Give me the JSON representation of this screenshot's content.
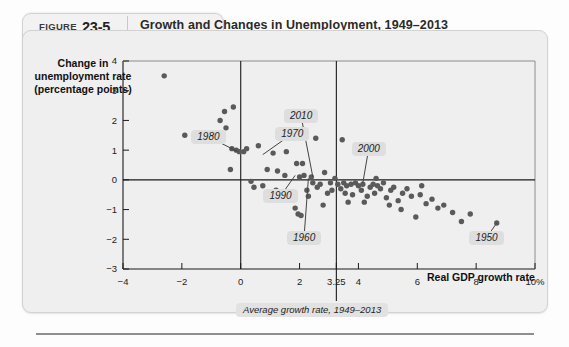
{
  "figure": {
    "label_word": "Figure",
    "number": "23-5",
    "title": "Growth and Changes in Unemployment, 1949–2013"
  },
  "axes": {
    "ylabel": "Change in unemployment rate (percentage points)",
    "xlabel": "Real GDP growth rate",
    "x_unit_suffix": "10%",
    "average_note": "Average growth rate, 1949–2013"
  },
  "chart_data": {
    "type": "scatter",
    "title": "Growth and Changes in Unemployment, 1949–2013",
    "xlabel": "Real GDP growth rate",
    "ylabel": "Change in unemployment rate (percentage points)",
    "xlim": [
      -4,
      10
    ],
    "ylim": [
      -3,
      4
    ],
    "xticks": [
      -4,
      -2,
      0,
      2,
      3.25,
      4,
      6,
      8,
      10
    ],
    "xticklabels": [
      "−4",
      "−2",
      "0",
      "2",
      "3.25",
      "4",
      "6",
      "8",
      "10%"
    ],
    "yticks": [
      4,
      3,
      2,
      1,
      0,
      -1,
      -2,
      -3
    ],
    "yticklabels": [
      "4",
      "3",
      "2",
      "1",
      "0",
      "−1",
      "−2",
      "−3"
    ],
    "grid": false,
    "legend": null,
    "reference_lines": [
      {
        "axis": "y",
        "value": 0,
        "style": "solid"
      },
      {
        "axis": "x",
        "value": 0,
        "style": "solid"
      },
      {
        "axis": "x",
        "value": 3.25,
        "style": "solid",
        "note": "Average growth rate, 1949–2013"
      }
    ],
    "marker_color": "#5a5a5a",
    "points": [
      [
        -2.6,
        3.5
      ],
      [
        -1.9,
        1.5
      ],
      [
        -0.55,
        2.3
      ],
      [
        -0.7,
        2.0
      ],
      [
        -0.5,
        1.75
      ],
      [
        -0.25,
        2.45
      ],
      [
        -0.3,
        1.05
      ],
      [
        -0.15,
        1.0
      ],
      [
        -0.05,
        0.95
      ],
      [
        0.1,
        0.95
      ],
      [
        0.2,
        1.05
      ],
      [
        -0.35,
        0.35
      ],
      [
        0.6,
        1.15
      ],
      [
        0.9,
        0.35
      ],
      [
        1.1,
        0.9
      ],
      [
        1.25,
        0.3
      ],
      [
        1.5,
        0.15
      ],
      [
        1.55,
        0.95
      ],
      [
        1.75,
        1.55
      ],
      [
        1.9,
        0.55
      ],
      [
        2.0,
        0.1
      ],
      [
        2.1,
        0.55
      ],
      [
        2.15,
        0.15
      ],
      [
        2.25,
        -0.35
      ],
      [
        2.3,
        -0.55
      ],
      [
        2.4,
        0.1
      ],
      [
        2.45,
        -0.1
      ],
      [
        2.55,
        1.4
      ],
      [
        2.6,
        -0.25
      ],
      [
        2.7,
        -0.15
      ],
      [
        2.85,
        0.25
      ],
      [
        2.95,
        -0.45
      ],
      [
        3.05,
        -0.1
      ],
      [
        3.1,
        -0.35
      ],
      [
        3.3,
        -0.15
      ],
      [
        3.4,
        -0.3
      ],
      [
        3.5,
        -0.1
      ],
      [
        3.55,
        -0.45
      ],
      [
        3.6,
        -0.2
      ],
      [
        3.75,
        -0.15
      ],
      [
        3.8,
        -0.5
      ],
      [
        3.9,
        -0.1
      ],
      [
        4.0,
        -0.2
      ],
      [
        4.1,
        -0.35
      ],
      [
        4.15,
        -0.15
      ],
      [
        4.3,
        -0.55
      ],
      [
        4.4,
        -0.25
      ],
      [
        4.5,
        -0.15
      ],
      [
        4.55,
        -0.45
      ],
      [
        4.65,
        -0.2
      ],
      [
        4.75,
        -0.3
      ],
      [
        4.85,
        -0.1
      ],
      [
        4.95,
        -0.6
      ],
      [
        5.1,
        -0.35
      ],
      [
        5.2,
        -0.25
      ],
      [
        5.35,
        -0.7
      ],
      [
        5.5,
        -0.45
      ],
      [
        5.65,
        -0.3
      ],
      [
        5.8,
        -0.55
      ],
      [
        5.95,
        -1.25
      ],
      [
        6.1,
        -0.5
      ],
      [
        6.3,
        -0.8
      ],
      [
        6.5,
        -0.65
      ],
      [
        6.7,
        -0.95
      ],
      [
        6.9,
        -0.85
      ],
      [
        7.2,
        -1.1
      ],
      [
        7.5,
        -1.4
      ],
      [
        7.8,
        -1.15
      ],
      [
        8.7,
        -1.45
      ],
      [
        1.85,
        -0.95
      ],
      [
        1.95,
        -1.15
      ],
      [
        2.05,
        -1.2
      ],
      [
        0.35,
        -0.05
      ],
      [
        0.45,
        -0.25
      ],
      [
        1.2,
        -0.35
      ],
      [
        1.35,
        -0.6
      ],
      [
        0.75,
        -0.2
      ],
      [
        3.2,
        0.05
      ],
      [
        4.6,
        0.05
      ],
      [
        -1.2,
        1.55
      ],
      [
        3.45,
        1.35
      ],
      [
        6.15,
        -0.2
      ],
      [
        2.8,
        -0.85
      ],
      [
        3.65,
        -0.75
      ],
      [
        4.2,
        -0.75
      ],
      [
        5.05,
        -0.85
      ],
      [
        5.45,
        -1.0
      ]
    ],
    "annotations": [
      {
        "label": "1980",
        "x": -0.1,
        "y": 0.95,
        "box_x": -1.1,
        "box_y": 1.45
      },
      {
        "label": "1970",
        "x": 0.75,
        "y": 0.85,
        "box_x": 1.75,
        "box_y": 1.55
      },
      {
        "label": "2010",
        "x": 2.45,
        "y": 0.1,
        "box_x": 2.05,
        "box_y": 2.15
      },
      {
        "label": "1990",
        "x": 1.85,
        "y": 0.15,
        "box_x": 1.35,
        "box_y": -0.55
      },
      {
        "label": "1960",
        "x": 2.3,
        "y": 0.05,
        "box_x": 2.15,
        "box_y": -1.95
      },
      {
        "label": "2000",
        "x": 4.15,
        "y": -0.1,
        "box_x": 4.35,
        "box_y": 1.05
      },
      {
        "label": "1950",
        "x": 8.7,
        "y": -1.45,
        "box_x": 8.35,
        "box_y": -1.95
      }
    ]
  }
}
